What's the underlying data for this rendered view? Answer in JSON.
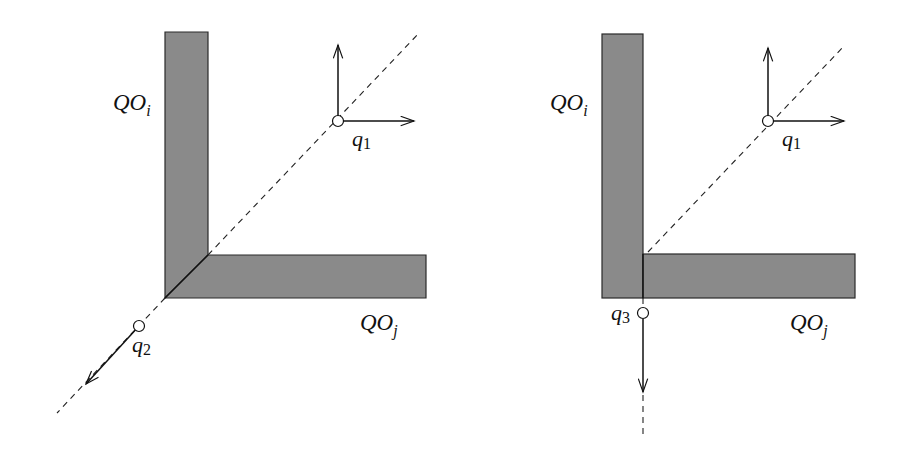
{
  "figure": {
    "panels": [
      {
        "id": "left",
        "obstacles": [
          {
            "label_main": "QO",
            "label_sub": "i",
            "orientation": "vertical"
          },
          {
            "label_main": "QO",
            "label_sub": "j",
            "orientation": "horizontal"
          }
        ],
        "corner_style": "mitred-diagonal",
        "points": [
          {
            "label_main": "q",
            "label_sub": "1",
            "vectors": [
              "up",
              "right"
            ]
          },
          {
            "label_main": "q",
            "label_sub": "2",
            "vectors": [
              "down-left"
            ]
          }
        ]
      },
      {
        "id": "right",
        "obstacles": [
          {
            "label_main": "QO",
            "label_sub": "i",
            "orientation": "vertical"
          },
          {
            "label_main": "QO",
            "label_sub": "j",
            "orientation": "horizontal"
          }
        ],
        "corner_style": "vertical-split",
        "points": [
          {
            "label_main": "q",
            "label_sub": "1",
            "vectors": [
              "up",
              "right"
            ]
          },
          {
            "label_main": "q",
            "label_sub": "3",
            "vectors": [
              "down"
            ]
          }
        ]
      }
    ],
    "colors": {
      "obstacle_fill": "#8a8a8a",
      "stroke": "#111111",
      "background": "#ffffff"
    }
  }
}
